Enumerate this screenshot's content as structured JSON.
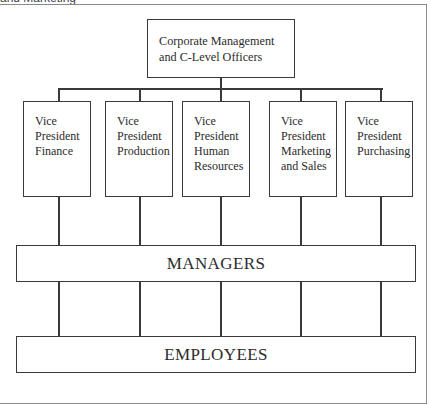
{
  "caption": "and Marketing",
  "chart": {
    "top": {
      "label_lines": [
        "Corporate Management",
        "and C-Level Officers"
      ]
    },
    "vice_presidents": [
      {
        "id": "finance",
        "lines": [
          "Vice",
          "President",
          "Finance"
        ],
        "left": 23,
        "center": 59
      },
      {
        "id": "production",
        "lines": [
          "Vice",
          "President",
          "Production"
        ],
        "left": 105,
        "center": 140
      },
      {
        "id": "human-resources",
        "lines": [
          "Vice",
          "President",
          "Human",
          "Resources"
        ],
        "left": 182,
        "center": 221
      },
      {
        "id": "marketing-sales",
        "lines": [
          "Vice",
          "President",
          "Marketing",
          "and Sales"
        ],
        "left": 269,
        "center": 301
      },
      {
        "id": "purchasing",
        "lines": [
          "Vice",
          "President",
          "Purchasing"
        ],
        "left": 345,
        "center": 381
      }
    ],
    "managers": {
      "label": "MANAGERS"
    },
    "employees": {
      "label": "EMPLOYEES"
    }
  },
  "colors": {
    "line": "#3a3a3a",
    "text": "#2b2b2b",
    "background": "#ffffff",
    "frame": "#8a8a8a"
  }
}
